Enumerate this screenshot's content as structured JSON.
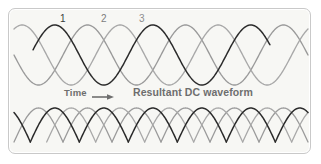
{
  "figure": {
    "title": "",
    "background_color": "#f7f7f4",
    "border_color": "#c9c9c9"
  },
  "labels": {
    "phase_1": "1",
    "phase_2": "2",
    "phase_3": "3",
    "time": "Time",
    "time_arrow_icon": "right-arrow-icon",
    "resultant": "Resultant DC waveform"
  },
  "colors": {
    "phase_1": "#2b2b2b",
    "phase_2": "#9a9a9a",
    "phase_3": "#a8a8a8",
    "text_gray": "#6e6e6e",
    "label_dark": "#3b3b3b"
  },
  "chart_data": {
    "type": "line",
    "xlabel": "Time",
    "ylabel": "",
    "grid": false,
    "legend": "inline-curve-labels",
    "panels": [
      {
        "name": "three-phase-ac",
        "description": "Three sinusoids 120 degrees apart",
        "x_range_deg": [
          -60,
          1020
        ],
        "ylim": [
          -1,
          1
        ],
        "series": [
          {
            "name": "1",
            "phase_deg": 0,
            "amplitude": 1,
            "color": "#2b2b2b",
            "period_deg": 360
          },
          {
            "name": "2",
            "phase_deg": 120,
            "amplitude": 1,
            "color": "#9a9a9a",
            "period_deg": 360
          },
          {
            "name": "3",
            "phase_deg": 240,
            "amplitude": 1,
            "color": "#a8a8a8",
            "period_deg": 360
          }
        ]
      },
      {
        "name": "resultant-dc",
        "description": "Full-wave rectified humps, absolute value of each phase",
        "x_range_deg": [
          -60,
          1020
        ],
        "ylim": [
          0,
          1
        ],
        "series": [
          {
            "name": "1",
            "phase_deg": 0,
            "amplitude": 1,
            "color": "#2b2b2b",
            "rectified": true
          },
          {
            "name": "2",
            "phase_deg": 120,
            "amplitude": 1,
            "color": "#9a9a9a",
            "rectified": true
          },
          {
            "name": "3",
            "phase_deg": 240,
            "amplitude": 1,
            "color": "#a8a8a8",
            "rectified": true
          }
        ]
      }
    ]
  }
}
